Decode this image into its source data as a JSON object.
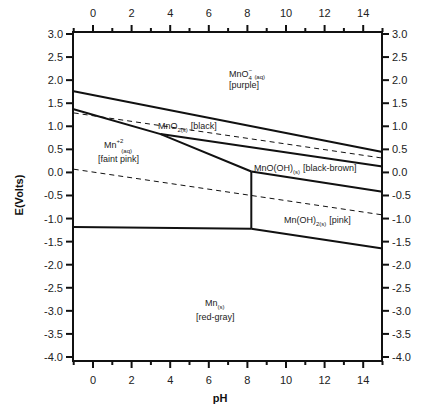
{
  "chart_data": {
    "type": "line",
    "title": "",
    "xlabel": "pH",
    "ylabel": "E(Volts)",
    "xlim": [
      -1,
      15
    ],
    "ylim": [
      -4.0,
      3.0
    ],
    "grid": false,
    "x_ticks_major": [
      0,
      2,
      4,
      6,
      8,
      10,
      12,
      14
    ],
    "x_tick_labels": [
      "0",
      "2",
      "4",
      "6",
      "8",
      "10",
      "12",
      "14"
    ],
    "y_ticks": [
      3.0,
      2.5,
      2.0,
      1.5,
      1.0,
      0.5,
      0.0,
      -0.5,
      -1.0,
      -1.5,
      -2.0,
      -2.5,
      -3.0,
      -3.5,
      -4.0
    ],
    "y_tick_labels": [
      "3.0",
      "2.5",
      "2.0",
      "1.5",
      "1.0",
      "0.5",
      "0.0",
      "-0.5",
      "-1.0",
      "-1.5",
      "-2.0",
      "-2.5",
      "-3.0",
      "-3.5",
      "-4.0"
    ],
    "series": [
      {
        "name": "MnO4- / MnO2 boundary",
        "style": "solid",
        "points": [
          [
            -1,
            1.76
          ],
          [
            15,
            0.44
          ]
        ]
      },
      {
        "name": "O2/H2O water stability (upper)",
        "style": "dashed",
        "points": [
          [
            -1,
            1.29
          ],
          [
            15,
            0.31
          ]
        ]
      },
      {
        "name": "Mn2+ / MnO2 boundary",
        "style": "solid",
        "points": [
          [
            -1,
            1.37
          ],
          [
            3.5,
            0.83
          ],
          [
            8.2,
            0.02
          ]
        ]
      },
      {
        "name": "MnO2 / MnO(OH) boundary",
        "style": "solid",
        "points": [
          [
            3.5,
            0.83
          ],
          [
            15,
            0.13
          ]
        ]
      },
      {
        "name": "MnO(OH) / Mn(OH)2 boundary",
        "style": "solid",
        "points": [
          [
            8.2,
            0.02
          ],
          [
            15,
            -0.42
          ]
        ]
      },
      {
        "name": "H2O/H2 water stability (lower)",
        "style": "dashed",
        "points": [
          [
            -1,
            0.07
          ],
          [
            15,
            -0.92
          ]
        ]
      },
      {
        "name": "Mn2+ / Mn(OH)2 boundary",
        "style": "solid",
        "points": [
          [
            8.2,
            0.02
          ],
          [
            8.2,
            -1.22
          ]
        ]
      },
      {
        "name": "Mn2+ / Mn boundary",
        "style": "solid",
        "points": [
          [
            -1,
            -1.18
          ],
          [
            8.2,
            -1.22
          ]
        ]
      },
      {
        "name": "Mn(OH)2 / Mn boundary",
        "style": "solid",
        "points": [
          [
            8.2,
            -1.22
          ],
          [
            15,
            -1.65
          ]
        ]
      }
    ],
    "annotations": [
      {
        "species": "MnO",
        "sub": "4",
        "sup": "−",
        "phase": "(aq)",
        "color_note": "[purple]",
        "pH": 7.5,
        "E": 2.4
      },
      {
        "species": "MnO",
        "sub": "2(s)",
        "sup": "",
        "phase": "",
        "color_note": "[black]",
        "pH": 3.5,
        "E": 1.0
      },
      {
        "species": "Mn",
        "sub": "",
        "sup": "+2",
        "phase": "(aq)",
        "color_note": "[faint pink]",
        "pH": 1.3,
        "E": 0.6
      },
      {
        "species": "MnO(OH)",
        "sub": "(s)",
        "sup": "",
        "phase": "",
        "color_note": "[black-brown]",
        "pH": 11.0,
        "E": 0.05
      },
      {
        "species": "Mn(OH)",
        "sub": "2(s)",
        "sup": "",
        "phase": "",
        "color_note": "[pink]",
        "pH": 11.3,
        "E": -1.0
      },
      {
        "species": "Mn",
        "sub": "(s)",
        "sup": "",
        "phase": "",
        "color_note": "[red-gray]",
        "pH": 6.1,
        "E": -3.0
      }
    ]
  },
  "labels": {
    "x_axis_title": "pH",
    "y_axis_title": "E(Volts)",
    "regions": {
      "mno4": {
        "main": "MnO",
        "sub": "4",
        "sup": "−",
        "phase": "(aq)",
        "note": "[purple]"
      },
      "mno2": {
        "main": "MnO",
        "sub": "2(s)",
        "note": "[black]"
      },
      "mn2": {
        "main": "Mn",
        "sup": "+2",
        "phase": "(aq)",
        "note": "[faint pink]"
      },
      "mnooh": {
        "main": "MnO(OH)",
        "sub": "(s)",
        "note": "[black-brown]"
      },
      "mnoh2": {
        "main": "Mn(OH)",
        "sub": "2(s)",
        "note": "[pink]"
      },
      "mn": {
        "main": "Mn",
        "sub": "(s)",
        "note": "[red-gray]"
      }
    }
  },
  "colors": {
    "line": "#111111",
    "text": "#222222",
    "background": "#ffffff"
  }
}
